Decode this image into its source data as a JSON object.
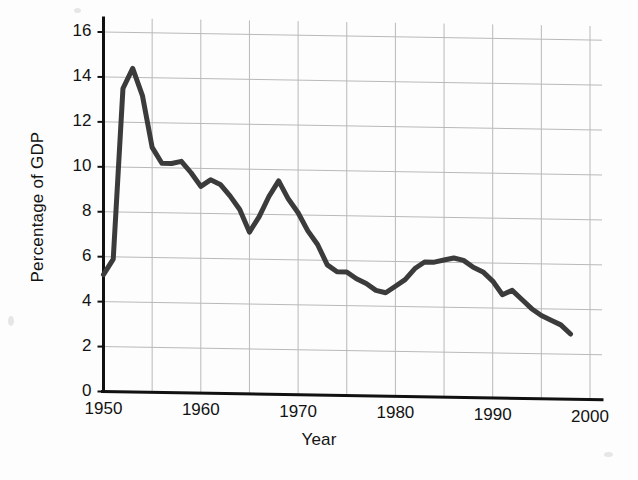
{
  "figure": {
    "kind": "line-chart",
    "line_color": "#3b3b3b",
    "grid_color": "#b9b9b9",
    "axis_color": "#111111",
    "background": "#fdfdfd"
  },
  "chart_data": {
    "type": "line",
    "title": "",
    "subtitle": "",
    "xlabel": "Year",
    "ylabel": "Percentage of GDP",
    "xlim": [
      1950,
      2000
    ],
    "ylim": [
      0,
      16
    ],
    "grid": true,
    "legend": "none",
    "x_ticks": [
      1950,
      1960,
      1970,
      1980,
      1990,
      2000
    ],
    "x_tick_labels": [
      "1950",
      "1960",
      "1970",
      "1980",
      "1990",
      "2000"
    ],
    "x_minor_gridlines": [
      1955,
      1965,
      1975,
      1985,
      1995
    ],
    "y_ticks": [
      0,
      2,
      4,
      6,
      8,
      10,
      12,
      14,
      16
    ],
    "y_tick_labels": [
      "0",
      "2",
      "4",
      "6",
      "8",
      "10",
      "12",
      "14",
      "16"
    ],
    "series": [
      {
        "name": "Percentage of GDP",
        "color": "#3b3b3b",
        "x": [
          1950,
          1951,
          1952,
          1953,
          1954,
          1955,
          1956,
          1957,
          1958,
          1959,
          1960,
          1961,
          1962,
          1963,
          1964,
          1965,
          1966,
          1967,
          1968,
          1969,
          1970,
          1971,
          1972,
          1973,
          1974,
          1975,
          1976,
          1977,
          1978,
          1979,
          1980,
          1981,
          1982,
          1983,
          1984,
          1985,
          1986,
          1987,
          1988,
          1989,
          1990,
          1991,
          1992,
          1993,
          1994,
          1995,
          1996,
          1997,
          1998
        ],
        "values": [
          5.2,
          5.9,
          13.5,
          14.4,
          13.2,
          10.9,
          10.2,
          10.2,
          10.3,
          9.8,
          9.2,
          9.5,
          9.3,
          8.8,
          8.2,
          7.2,
          7.9,
          8.8,
          9.5,
          8.7,
          8.1,
          7.3,
          6.7,
          5.8,
          5.5,
          5.5,
          5.2,
          5.0,
          4.7,
          4.6,
          4.9,
          5.2,
          5.7,
          6.0,
          6.0,
          6.1,
          6.2,
          6.1,
          5.8,
          5.6,
          5.2,
          4.6,
          4.8,
          4.4,
          4.0,
          3.7,
          3.5,
          3.3,
          2.9
        ]
      }
    ],
    "annotations": [],
    "notable_points": {
      "korean_war_peak": {
        "year": 1953,
        "value": 14.4
      },
      "post_korea_plateau": {
        "year": 1957,
        "value": 10.2
      },
      "pre_vietnam_trough": {
        "year": 1965,
        "value": 7.2
      },
      "vietnam_peak": {
        "year": 1968,
        "value": 9.5
      },
      "late_seventies_trough": {
        "year": 1979,
        "value": 4.6
      },
      "cold_war_buildup_peak": {
        "year": 1986,
        "value": 6.2
      },
      "final_point": {
        "year": 1998,
        "value": 2.9
      }
    }
  }
}
